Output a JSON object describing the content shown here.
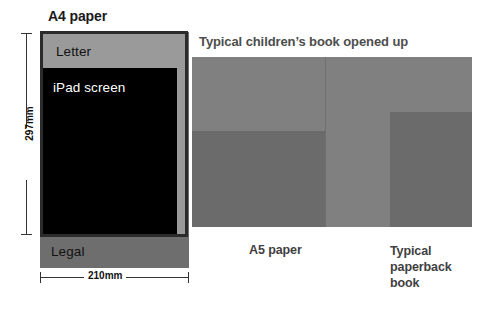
{
  "diagram": {
    "title_a4": "A4 paper",
    "title_book": "Typical children’s book opened up",
    "labels": {
      "letter": "Letter",
      "ipad": "iPad screen",
      "legal": "Legal",
      "a5": "A5 paper",
      "paperback": "Typical\npaperback\nbook"
    },
    "paperback_lines": {
      "line1": "Typical",
      "line2": "paperback",
      "line3": "book"
    },
    "dimensions": {
      "height": "297mm",
      "width": "210mm"
    },
    "colors": {
      "a4_fill": "#9a9a9a",
      "a4_border": "#2b2b2b",
      "legal_fill": "#6e6e6e",
      "ipad_fill": "#000000",
      "book_fill": "#808080",
      "a5_fill": "#6b6b6b",
      "paperback_fill": "#6b6b6b",
      "title_dark": "#1a1a1a",
      "title_gray": "#4d4d4d",
      "background": "#ffffff"
    }
  },
  "chart_data": {
    "type": "diagram",
    "items": [
      {
        "name": "A4 paper",
        "width_mm": 210,
        "height_mm": 297,
        "fill": "#9a9a9a"
      },
      {
        "name": "Letter",
        "fill": "#9a9a9a"
      },
      {
        "name": "iPad screen",
        "fill": "#000000"
      },
      {
        "name": "Legal",
        "fill": "#6e6e6e"
      },
      {
        "name": "Typical children’s book opened up",
        "fill": "#808080"
      },
      {
        "name": "A5 paper",
        "fill": "#6b6b6b"
      },
      {
        "name": "Typical paperback book",
        "fill": "#6b6b6b"
      }
    ],
    "annotations": [
      "297mm",
      "210mm"
    ]
  }
}
